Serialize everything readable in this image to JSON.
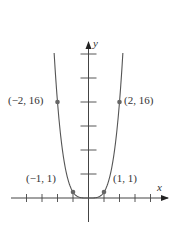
{
  "chart_data": {
    "type": "line",
    "title": "",
    "function": "y = x^4",
    "xlabel": "x",
    "ylabel": "y",
    "xlim": [
      -5,
      5
    ],
    "ylim": [
      -4,
      26
    ],
    "x_ticks": [
      -4,
      -3,
      -2,
      -1,
      1,
      2,
      3,
      4
    ],
    "y_ticks": [
      4,
      8,
      12,
      16,
      20,
      24
    ],
    "grid": false,
    "series": [
      {
        "name": "y = x^4",
        "x": [
          -2.2,
          -2,
          -1.5,
          -1,
          -0.5,
          0,
          0.5,
          1,
          1.5,
          2,
          2.2
        ],
        "y": [
          23.4,
          16,
          5.06,
          1,
          0.06,
          0,
          0.06,
          1,
          5.06,
          16,
          23.4
        ]
      }
    ],
    "points": [
      {
        "x": -2,
        "y": 16,
        "label": "(−2, 16)"
      },
      {
        "x": 2,
        "y": 16,
        "label": "(2, 16)"
      },
      {
        "x": -1,
        "y": 1,
        "label": "(−1, 1)"
      },
      {
        "x": 1,
        "y": 1,
        "label": "(1, 1)"
      }
    ],
    "colors": {
      "curve": "#555555",
      "axis": "#444444",
      "point": "#666666"
    }
  },
  "labels": {
    "x_axis": "x",
    "y_axis": "y",
    "p_neg2": "(−2, 16)",
    "p_pos2": "(2, 16)",
    "p_neg1": "(−1, 1)",
    "p_pos1": "(1, 1)"
  }
}
